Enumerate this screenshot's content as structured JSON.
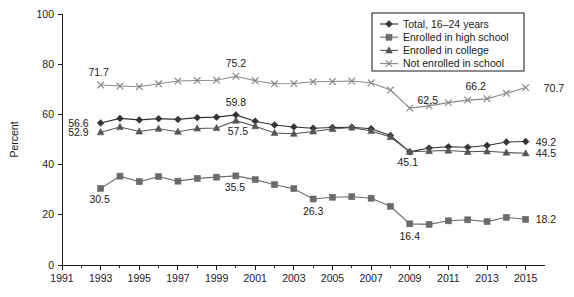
{
  "chart_data": {
    "type": "line",
    "title": "",
    "xlabel": "",
    "ylabel": "Percent",
    "xlim": [
      1991,
      2016
    ],
    "ylim": [
      0,
      100
    ],
    "grid": false,
    "legend_position": "top-right",
    "x": [
      1993,
      1994,
      1995,
      1996,
      1997,
      1998,
      1999,
      2000,
      2001,
      2002,
      2003,
      2004,
      2005,
      2006,
      2007,
      2008,
      2009,
      2010,
      2011,
      2012,
      2013,
      2014,
      2015
    ],
    "xticks": [
      "1991",
      "1993",
      "1995",
      "1997",
      "1999",
      "2001",
      "2003",
      "2005",
      "2007",
      "2009",
      "2011",
      "2013",
      "2015"
    ],
    "yticks": [
      "0",
      "20",
      "40",
      "60",
      "80",
      "100"
    ],
    "series": [
      {
        "name": "Total, 16–24 years",
        "marker": "diamond",
        "color": "#333333",
        "values": [
          56.6,
          58.4,
          57.8,
          58.3,
          58.0,
          58.7,
          58.9,
          59.8,
          57.3,
          55.8,
          55.0,
          54.5,
          54.8,
          54.9,
          54.3,
          51.6,
          45.1,
          46.6,
          47.1,
          46.9,
          47.6,
          49.0,
          49.2
        ]
      },
      {
        "name": "Enrolled in high school",
        "marker": "square",
        "color": "#6b6b6b",
        "values": [
          30.5,
          35.4,
          33.2,
          35.2,
          33.4,
          34.5,
          35.0,
          35.5,
          34.0,
          32.0,
          30.4,
          26.3,
          27.0,
          27.2,
          26.6,
          23.4,
          16.4,
          16.2,
          17.6,
          18.0,
          17.3,
          19.0,
          18.2
        ]
      },
      {
        "name": "Enrolled in college",
        "marker": "triangle",
        "color": "#555555",
        "values": [
          52.9,
          55.0,
          53.2,
          54.3,
          53.1,
          54.4,
          54.6,
          57.5,
          55.3,
          52.6,
          52.3,
          53.2,
          54.2,
          54.8,
          53.4,
          51.0,
          45.1,
          45.4,
          45.6,
          45.1,
          45.3,
          44.8,
          44.5
        ]
      },
      {
        "name": "Not enrolled in school",
        "marker": "cross",
        "color": "#8a8a8a",
        "values": [
          71.7,
          71.3,
          71.0,
          72.2,
          73.3,
          73.5,
          73.6,
          75.2,
          73.4,
          72.2,
          72.3,
          73.0,
          73.1,
          73.3,
          72.6,
          69.7,
          62.5,
          63.4,
          64.7,
          65.7,
          66.2,
          68.4,
          70.7
        ]
      }
    ],
    "point_labels": [
      {
        "text": "71.7",
        "x": 1993,
        "y": 71.7,
        "dx": -2,
        "dy": -9,
        "anchor": "middle",
        "series": "Not enrolled in school"
      },
      {
        "text": "75.2",
        "x": 2000,
        "y": 75.2,
        "dx": 0,
        "dy": -9,
        "anchor": "middle",
        "series": "Not enrolled in school"
      },
      {
        "text": "62.5",
        "x": 2009,
        "y": 62.5,
        "dx": 18,
        "dy": -4,
        "anchor": "middle",
        "series": "Not enrolled in school"
      },
      {
        "text": "66.2",
        "x": 2012,
        "y": 65.7,
        "dx": 8,
        "dy": -10,
        "anchor": "middle",
        "series": "Not enrolled in school"
      },
      {
        "text": "70.7",
        "x": 2015,
        "y": 70.7,
        "dx": 18,
        "dy": 4,
        "anchor": "start",
        "series": "Not enrolled in school"
      },
      {
        "text": "56.6",
        "x": 1993,
        "y": 56.6,
        "dx": -12,
        "dy": 4,
        "anchor": "end",
        "series": "Total, 16–24 years"
      },
      {
        "text": "59.8",
        "x": 2000,
        "y": 59.8,
        "dx": 0,
        "dy": -9,
        "anchor": "middle",
        "series": "Total, 16–24 years"
      },
      {
        "text": "45.1",
        "x": 2009,
        "y": 45.1,
        "dx": -2,
        "dy": 14,
        "anchor": "middle",
        "series": "Total, 16–24 years"
      },
      {
        "text": "49.2",
        "x": 2015,
        "y": 49.2,
        "dx": 10,
        "dy": 4,
        "anchor": "start",
        "series": "Total, 16–24 years"
      },
      {
        "text": "52.9",
        "x": 1993,
        "y": 52.9,
        "dx": -12,
        "dy": 4,
        "anchor": "end",
        "series": "Enrolled in college"
      },
      {
        "text": "57.5",
        "x": 2000,
        "y": 57.5,
        "dx": 2,
        "dy": 14,
        "anchor": "middle",
        "series": "Enrolled in college"
      },
      {
        "text": "44.5",
        "x": 2015,
        "y": 44.5,
        "dx": 10,
        "dy": 4,
        "anchor": "start",
        "series": "Enrolled in college"
      },
      {
        "text": "30.5",
        "x": 1993,
        "y": 30.5,
        "dx": -1,
        "dy": 15,
        "anchor": "middle",
        "series": "Enrolled in high school"
      },
      {
        "text": "35.5",
        "x": 2000,
        "y": 35.5,
        "dx": -1,
        "dy": 15,
        "anchor": "middle",
        "series": "Enrolled in high school"
      },
      {
        "text": "26.3",
        "x": 2004,
        "y": 26.3,
        "dx": 0,
        "dy": 16,
        "anchor": "middle",
        "series": "Enrolled in high school"
      },
      {
        "text": "16.4",
        "x": 2009,
        "y": 16.4,
        "dx": 0,
        "dy": 16,
        "anchor": "middle",
        "series": "Enrolled in high school"
      },
      {
        "text": "18.2",
        "x": 2015,
        "y": 18.2,
        "dx": 10,
        "dy": 4,
        "anchor": "start",
        "series": "Enrolled in high school"
      }
    ]
  }
}
